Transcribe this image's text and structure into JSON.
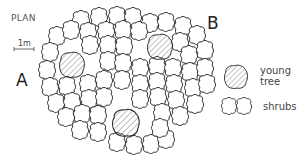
{
  "diagram": {
    "title": "PLAN",
    "scale_label": "1m",
    "labels": {
      "a": "A",
      "b": "B"
    },
    "legend": [
      {
        "symbol": "hatched-blob",
        "label_line1": "young",
        "label_line2": "tree"
      },
      {
        "symbol": "double-scallop",
        "label_line1": "shrubs"
      }
    ],
    "young_tree_count": 3,
    "colors": {
      "stroke": "#2a2a2a",
      "hatch": "#555555",
      "background": "#ffffff"
    }
  }
}
